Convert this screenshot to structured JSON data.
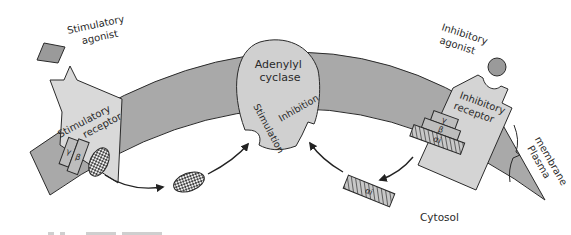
{
  "diagram": {
    "labels": {
      "stimulatory_agonist_line1": "Stimulatory",
      "stimulatory_agonist_line2": "agonist",
      "stimulatory_receptor_line1": "Stimulatory",
      "stimulatory_receptor_line2": "receptor",
      "adenylyl_cyclase_line1": "Adenylyl",
      "adenylyl_cyclase_line2": "cyclase",
      "stimulation": "Stimulation",
      "inhibition": "Inhibition",
      "inhibitory_agonist_line1": "Inhibitory",
      "inhibitory_agonist_line2": "agonist",
      "inhibitory_receptor_line1": "Inhibitory",
      "inhibitory_receptor_line2": "receptor",
      "plasma_membrane_line1": "Plasma",
      "plasma_membrane_line2": "membrane",
      "cytosol": "Cytosol"
    },
    "subunits": {
      "gamma": "γ",
      "beta": "β",
      "alpha_s": "αs",
      "alpha_i": "αi"
    },
    "colors": {
      "membrane": "#a9a9a9",
      "receptor": "#d9d9d9",
      "outline": "#2a2a2a",
      "agonist": "#9a9a9a",
      "subunit": "#bdbdbd"
    }
  }
}
